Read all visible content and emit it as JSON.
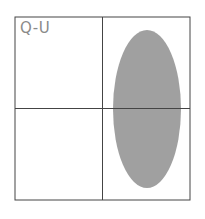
{
  "diagram": {
    "quadrant_label": "Q-U",
    "colors": {
      "border": "#444444",
      "axis": "#444444",
      "ellipse_fill": "#a0a0a0",
      "label": "#8a8a8a"
    },
    "ellipse": {
      "cx": 147,
      "cy": 109,
      "rx": 34,
      "ry": 79
    }
  }
}
